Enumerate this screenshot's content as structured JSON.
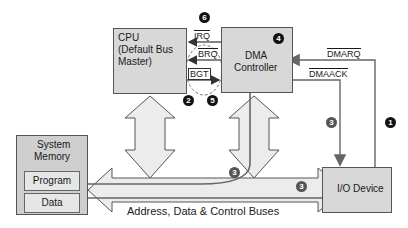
{
  "diagram": {
    "cpu": {
      "line1": "CPU",
      "line2": "(Default Bus",
      "line3": "Master)"
    },
    "dma": {
      "line1": "DMA",
      "line2": "Controller"
    },
    "memory": {
      "title_line1": "System",
      "title_line2": "Memory",
      "program": "Program",
      "data": "Data"
    },
    "io": {
      "label": "I/O Device"
    },
    "bus": {
      "label": "Address, Data & Control Buses"
    },
    "signals": {
      "irq": "IRQ",
      "brq": "BRQ",
      "bgt": "BGT",
      "dmarq": "DMARQ",
      "dmaack": "DMAACK"
    },
    "steps": {
      "s1": "1",
      "s2": "2",
      "s3": "3",
      "s4": "4",
      "s5": "5",
      "s6": "6"
    },
    "colors": {
      "box_fill": "#d8d8d8",
      "arrow_fill": "#ececec",
      "line": "#555555",
      "badge_black": "#111111",
      "badge_grey": "#555555"
    }
  }
}
